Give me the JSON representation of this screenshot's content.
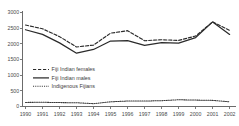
{
  "chart_data": {
    "type": "line",
    "title": "",
    "subtitle": "",
    "xlabel": "",
    "ylabel": "",
    "grid": false,
    "legend_position": "inside-left",
    "categories": [
      "1990",
      "1991",
      "1992",
      "1993",
      "1994",
      "1995",
      "1996",
      "1997",
      "1998",
      "1999",
      "2000",
      "2001",
      "2002"
    ],
    "x": [
      1990,
      1991,
      1992,
      1993,
      1994,
      1995,
      1996,
      1997,
      1998,
      1999,
      2000,
      2001,
      2002
    ],
    "xlim": [
      1990,
      2002
    ],
    "ylim": [
      0,
      3000
    ],
    "yticks": [
      0,
      500,
      1000,
      1500,
      2000,
      2500,
      3000
    ],
    "ytick_labels": [
      "0",
      "500",
      "1000",
      "1500",
      "2000",
      "2500",
      "3000"
    ],
    "series": [
      {
        "name": "Fiji Indian females",
        "style": "dashed",
        "color": "#2b2b2b",
        "values": [
          2600,
          2480,
          2230,
          1900,
          1960,
          2340,
          2420,
          2100,
          2130,
          2110,
          2250,
          2700,
          2430
        ]
      },
      {
        "name": "Fiji Indian males",
        "style": "solid",
        "color": "#2b2b2b",
        "values": [
          2450,
          2300,
          2030,
          1700,
          1820,
          2090,
          2100,
          1950,
          2040,
          2020,
          2200,
          2700,
          2300
        ]
      },
      {
        "name": "Indigenous Fijians",
        "style": "dotted",
        "color": "#3a3a3a",
        "values": [
          130,
          135,
          125,
          120,
          90,
          150,
          175,
          175,
          185,
          215,
          205,
          195,
          150
        ]
      }
    ]
  },
  "legend": {
    "entries": [
      {
        "label": "Fiji Indian females"
      },
      {
        "label": "Fiji Indian males"
      },
      {
        "label": "Indigenous Fijians"
      }
    ]
  },
  "axes": {
    "y_tick_labels": [
      "3000",
      "2500",
      "2000",
      "1500",
      "1000",
      "500",
      "0"
    ],
    "x_tick_labels": [
      "1990",
      "1991",
      "1992",
      "1993",
      "1994",
      "1995",
      "1996",
      "1997",
      "1998",
      "1999",
      "2000",
      "2001",
      "2002"
    ]
  }
}
